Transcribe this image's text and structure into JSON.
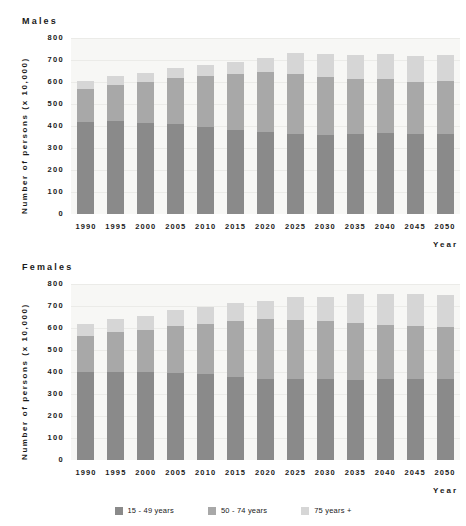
{
  "chart_data": [
    {
      "type": "bar",
      "title": "Males",
      "xlabel": "Year",
      "ylabel": "Number of persons (x 10,000)",
      "ylim": [
        0,
        800
      ],
      "yticks": [
        0,
        100,
        200,
        300,
        400,
        500,
        600,
        700,
        800
      ],
      "ytick_labels": [
        "0",
        "100",
        "200",
        "300",
        "400",
        "500",
        "600",
        "700",
        "800"
      ],
      "grid": true,
      "stacked": true,
      "legend_position": "bottom",
      "categories": [
        "1990",
        "1995",
        "2000",
        "2005",
        "2010",
        "2015",
        "2020",
        "2025",
        "2030",
        "2035",
        "2040",
        "2045",
        "2050"
      ],
      "series": [
        {
          "name": "15 - 49 years",
          "color": "#8a8a8a",
          "values": [
            418,
            421,
            415,
            408,
            396,
            383,
            372,
            364,
            360,
            362,
            367,
            364,
            365
          ]
        },
        {
          "name": "50 - 74 years",
          "color": "#a8a8a8",
          "values": [
            150,
            167,
            185,
            209,
            231,
            253,
            272,
            272,
            265,
            253,
            245,
            236,
            238
          ]
        },
        {
          "name": "75 years +",
          "color": "#d6d6d6",
          "values": [
            35,
            40,
            43,
            45,
            50,
            56,
            64,
            98,
            101,
            108,
            114,
            120,
            120
          ]
        }
      ],
      "totals": [
        603,
        628,
        643,
        662,
        677,
        692,
        708,
        734,
        726,
        723,
        726,
        720,
        723
      ]
    },
    {
      "type": "bar",
      "title": "Females",
      "xlabel": "Year",
      "ylabel": "Number of persons (x 10,000)",
      "ylim": [
        0,
        800
      ],
      "yticks": [
        0,
        100,
        200,
        300,
        400,
        500,
        600,
        700,
        800
      ],
      "ytick_labels": [
        "0",
        "100",
        "200",
        "300",
        "400",
        "500",
        "600",
        "700",
        "800"
      ],
      "grid": true,
      "stacked": true,
      "legend_position": "bottom",
      "categories": [
        "1990",
        "1995",
        "2000",
        "2005",
        "2010",
        "2015",
        "2020",
        "2025",
        "2030",
        "2035",
        "2040",
        "2045",
        "2050"
      ],
      "series": [
        {
          "name": "15 - 49 years",
          "color": "#8a8a8a",
          "values": [
            398,
            400,
            399,
            397,
            392,
            379,
            366,
            367,
            366,
            364,
            367,
            366,
            367
          ]
        },
        {
          "name": "50 - 74 years",
          "color": "#a8a8a8",
          "values": [
            166,
            180,
            193,
            211,
            227,
            253,
            274,
            268,
            266,
            260,
            246,
            242,
            237
          ]
        },
        {
          "name": "75 years +",
          "color": "#d6d6d6",
          "values": [
            56,
            60,
            64,
            72,
            78,
            83,
            85,
            107,
            110,
            129,
            142,
            146,
            148
          ]
        }
      ],
      "totals": [
        620,
        640,
        656,
        680,
        697,
        715,
        725,
        742,
        742,
        753,
        755,
        754,
        752
      ]
    }
  ],
  "legend": {
    "items": [
      {
        "label": "15 - 49 years",
        "color": "#8a8a8a"
      },
      {
        "label": "50 - 74 years",
        "color": "#a8a8a8"
      },
      {
        "label": "75 years +",
        "color": "#d6d6d6"
      }
    ]
  }
}
